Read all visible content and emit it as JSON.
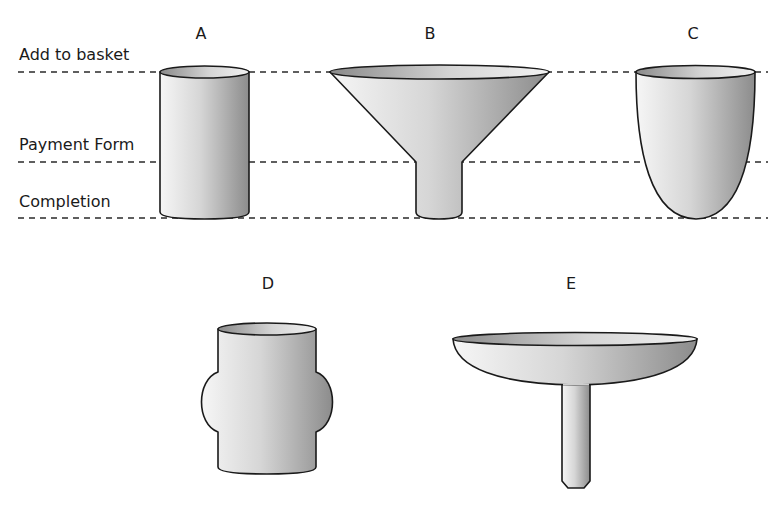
{
  "diagram": {
    "stages": [
      {
        "label": "Add to basket",
        "y": 72
      },
      {
        "label": "Payment Form",
        "y": 162
      },
      {
        "label": "Completion",
        "y": 218
      }
    ],
    "shapes": [
      {
        "id": "A",
        "label": "A",
        "form": "cylinder"
      },
      {
        "id": "B",
        "label": "B",
        "form": "funnel"
      },
      {
        "id": "C",
        "label": "C",
        "form": "rounded-cup"
      },
      {
        "id": "D",
        "label": "D",
        "form": "bulging-cylinder"
      },
      {
        "id": "E",
        "label": "E",
        "form": "shallow-bowl-with-stem"
      }
    ],
    "colors": {
      "stroke": "#1a1a1a",
      "fill_light": "#f4f4f4",
      "fill_dark": "#8a8a8a",
      "dash": "#2a2a2a"
    }
  }
}
